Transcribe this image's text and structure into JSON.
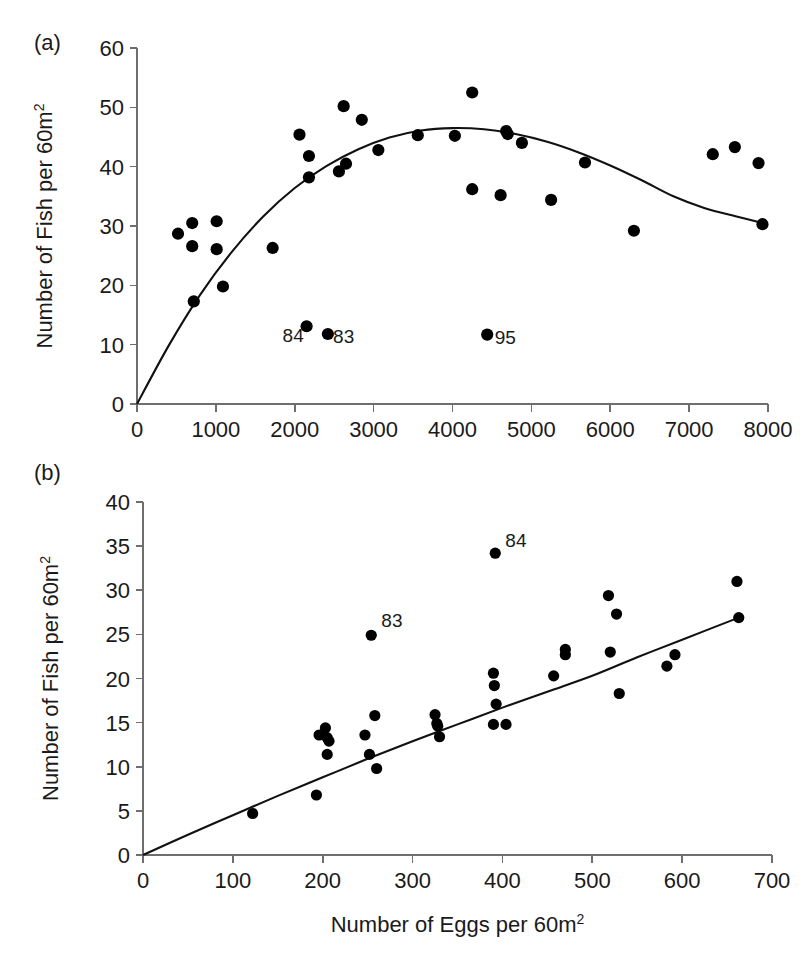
{
  "figure": {
    "background_color": "#ffffff",
    "point_color": "#000000",
    "curve_color": "#111111",
    "axis_color": "#6e6e6e",
    "xlabel": "Number of Eggs per 60m",
    "xlabel_sup": "2"
  },
  "chart_data": [
    {
      "type": "scatter",
      "panel": "(a)",
      "title": "",
      "xlabel": "Number of Eggs per 60m2",
      "ylabel": "Number of Fish per 60m2",
      "ylabel_main": "Number of Fish per 60m",
      "ylabel_sup": "2",
      "xlim": [
        0,
        8000
      ],
      "ylim": [
        0,
        60
      ],
      "xticks": [
        0,
        1000,
        2000,
        3000,
        4000,
        5000,
        6000,
        7000,
        8000
      ],
      "xticklabels": [
        "0",
        "1000",
        "2000",
        "3000",
        "4000",
        "5000",
        "6000",
        "7000",
        "8000"
      ],
      "yticks": [
        0,
        10,
        20,
        30,
        40,
        50,
        60
      ],
      "yticklabels": [
        "0",
        "10",
        "20",
        "30",
        "40",
        "50",
        "60"
      ],
      "grid": false,
      "legend": false,
      "points": [
        [
          520,
          28.7
        ],
        [
          700,
          30.5
        ],
        [
          700,
          26.6
        ],
        [
          720,
          17.3
        ],
        [
          1010,
          30.8
        ],
        [
          1010,
          26.1
        ],
        [
          1090,
          19.8
        ],
        [
          1720,
          26.3
        ],
        [
          2060,
          45.4
        ],
        [
          2150,
          13.1
        ],
        [
          2180,
          41.8
        ],
        [
          2180,
          38.2
        ],
        [
          2420,
          11.8
        ],
        [
          2560,
          39.2
        ],
        [
          2620,
          50.2
        ],
        [
          2650,
          40.5
        ],
        [
          2850,
          47.9
        ],
        [
          3060,
          42.8
        ],
        [
          3560,
          45.3
        ],
        [
          4030,
          45.2
        ],
        [
          4250,
          52.5
        ],
        [
          4250,
          36.2
        ],
        [
          4440,
          11.7
        ],
        [
          4610,
          35.2
        ],
        [
          4680,
          46.0
        ],
        [
          4700,
          45.5
        ],
        [
          4880,
          44.0
        ],
        [
          5250,
          34.4
        ],
        [
          5680,
          40.7
        ],
        [
          6300,
          29.2
        ],
        [
          7300,
          42.1
        ],
        [
          7580,
          43.3
        ],
        [
          7880,
          40.6
        ],
        [
          7930,
          30.3
        ]
      ],
      "annotations": [
        {
          "text": "84",
          "x": 1980,
          "y": 10.4
        },
        {
          "text": "83",
          "x": 2620,
          "y": 10.2
        },
        {
          "text": "95",
          "x": 4670,
          "y": 10.1
        }
      ],
      "fit_curve": {
        "kind": "quadratic-hump",
        "description": "rises from origin, peaks near x=3800 at y=46.5, declines to y=30.5 at x=7930",
        "points": [
          [
            0,
            0
          ],
          [
            400,
            9.8
          ],
          [
            800,
            18.4
          ],
          [
            1200,
            25.6
          ],
          [
            1600,
            31.6
          ],
          [
            2000,
            36.4
          ],
          [
            2400,
            40.1
          ],
          [
            2800,
            42.9
          ],
          [
            3200,
            44.9
          ],
          [
            3600,
            46.1
          ],
          [
            4000,
            46.5
          ],
          [
            4400,
            46.3
          ],
          [
            4800,
            45.5
          ],
          [
            5200,
            44.2
          ],
          [
            5600,
            42.4
          ],
          [
            6000,
            40.2
          ],
          [
            6400,
            37.7
          ],
          [
            6800,
            35.0
          ],
          [
            7200,
            33.0
          ],
          [
            7600,
            31.6
          ],
          [
            7930,
            30.5
          ]
        ]
      }
    },
    {
      "type": "scatter",
      "panel": "(b)",
      "title": "",
      "xlabel": "Number of Eggs per 60m2",
      "ylabel": "Number of Fish per 60m2",
      "ylabel_main": "Number of Fish per 60m",
      "ylabel_sup": "2",
      "xlim": [
        0,
        700
      ],
      "ylim": [
        0,
        40
      ],
      "xticks": [
        0,
        100,
        200,
        300,
        400,
        500,
        600,
        700
      ],
      "xticklabels": [
        "0",
        "100",
        "200",
        "300",
        "400",
        "500",
        "600",
        "700"
      ],
      "yticks": [
        0,
        5,
        10,
        15,
        20,
        25,
        30,
        35,
        40
      ],
      "yticklabels": [
        "0",
        "5",
        "10",
        "15",
        "20",
        "25",
        "30",
        "35",
        "40"
      ],
      "grid": false,
      "legend": false,
      "points": [
        [
          122,
          4.7
        ],
        [
          193,
          6.8
        ],
        [
          196,
          13.6
        ],
        [
          203,
          14.4
        ],
        [
          205,
          13.3
        ],
        [
          207,
          12.9
        ],
        [
          205,
          11.4
        ],
        [
          247,
          13.6
        ],
        [
          252,
          11.4
        ],
        [
          254,
          24.9
        ],
        [
          258,
          15.8
        ],
        [
          260,
          9.8
        ],
        [
          325,
          15.9
        ],
        [
          327,
          14.9
        ],
        [
          328,
          14.6
        ],
        [
          330,
          13.4
        ],
        [
          390,
          20.6
        ],
        [
          391,
          19.2
        ],
        [
          392,
          34.2
        ],
        [
          393,
          17.1
        ],
        [
          390,
          14.8
        ],
        [
          404,
          14.8
        ],
        [
          457,
          20.3
        ],
        [
          470,
          23.3
        ],
        [
          470,
          22.7
        ],
        [
          518,
          29.4
        ],
        [
          520,
          23.0
        ],
        [
          527,
          27.3
        ],
        [
          530,
          18.3
        ],
        [
          583,
          21.4
        ],
        [
          592,
          22.7
        ],
        [
          661,
          31.0
        ],
        [
          663,
          26.9
        ]
      ],
      "annotations": [
        {
          "text": "83",
          "x": 277,
          "y": 25.8
        },
        {
          "text": "84",
          "x": 415,
          "y": 34.9
        }
      ],
      "fit_curve": {
        "kind": "concave-increasing",
        "description": "rises from origin with decreasing slope, reaching y=26.9 at x=663",
        "points": [
          [
            0,
            0
          ],
          [
            50,
            2.3
          ],
          [
            100,
            4.5
          ],
          [
            150,
            6.7
          ],
          [
            200,
            8.8
          ],
          [
            250,
            10.9
          ],
          [
            300,
            12.9
          ],
          [
            350,
            14.8
          ],
          [
            400,
            16.7
          ],
          [
            450,
            18.5
          ],
          [
            500,
            20.3
          ],
          [
            550,
            22.4
          ],
          [
            600,
            24.4
          ],
          [
            663,
            26.9
          ]
        ]
      }
    }
  ]
}
